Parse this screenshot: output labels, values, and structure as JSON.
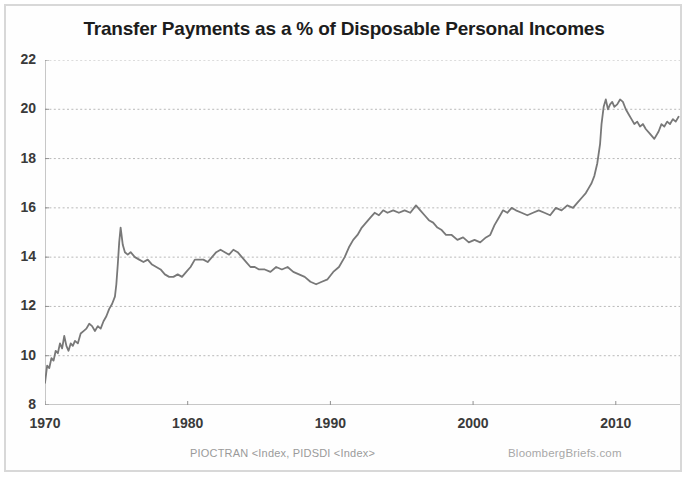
{
  "figure": {
    "title": "Transfer Payments as a % of Disposable Personal Incomes",
    "source_label": "PIOCTRAN <Index, PIDSDI <Index>",
    "brand_label": "BloombergBriefs.com",
    "line_color": "#787878",
    "grid_color": "#b9b9b9",
    "axis_color": "#909090",
    "text_color": "#3a3a3a",
    "border_color": "#d8d8d8"
  },
  "chart_data": {
    "type": "line",
    "title": "Transfer Payments as a % of Disposable Personal Incomes",
    "xlabel": "",
    "ylabel": "",
    "xlim": [
      1970,
      2014.5
    ],
    "ylim": [
      8,
      22
    ],
    "grid": true,
    "legend": "none",
    "y_ticks": [
      8,
      10,
      12,
      14,
      16,
      18,
      20,
      22
    ],
    "y_tick_labels": [
      "8",
      "10",
      "12",
      "14",
      "16",
      "18",
      "20",
      "22"
    ],
    "x_ticks": [
      1970,
      1980,
      1990,
      2000,
      2010
    ],
    "x_tick_labels": [
      "1970",
      "1980",
      "1990",
      "2000",
      "2010"
    ],
    "series": [
      {
        "name": "Transfer Payments as % of Disposable Personal Income",
        "x": [
          1970.0,
          1970.15,
          1970.3,
          1970.45,
          1970.6,
          1970.75,
          1970.9,
          1971.05,
          1971.2,
          1971.35,
          1971.5,
          1971.65,
          1971.8,
          1971.95,
          1972.1,
          1972.3,
          1972.5,
          1972.7,
          1972.9,
          1973.1,
          1973.3,
          1973.5,
          1973.7,
          1973.9,
          1974.1,
          1974.3,
          1974.5,
          1974.7,
          1974.9,
          1975.0,
          1975.1,
          1975.2,
          1975.3,
          1975.45,
          1975.6,
          1975.8,
          1976.0,
          1976.3,
          1976.6,
          1976.9,
          1977.2,
          1977.5,
          1977.8,
          1978.1,
          1978.4,
          1978.7,
          1979.0,
          1979.3,
          1979.6,
          1979.9,
          1980.2,
          1980.5,
          1980.8,
          1981.1,
          1981.4,
          1981.7,
          1982.0,
          1982.3,
          1982.6,
          1982.9,
          1983.2,
          1983.5,
          1983.8,
          1984.1,
          1984.4,
          1984.7,
          1985.0,
          1985.4,
          1985.8,
          1986.2,
          1986.6,
          1987.0,
          1987.4,
          1987.8,
          1988.2,
          1988.6,
          1989.0,
          1989.4,
          1989.8,
          1990.2,
          1990.6,
          1991.0,
          1991.3,
          1991.6,
          1991.9,
          1992.2,
          1992.5,
          1992.8,
          1993.1,
          1993.4,
          1993.7,
          1994.0,
          1994.4,
          1994.8,
          1995.2,
          1995.6,
          1996.0,
          1996.3,
          1996.6,
          1996.9,
          1997.2,
          1997.5,
          1997.8,
          1998.1,
          1998.5,
          1998.9,
          1999.3,
          1999.7,
          2000.1,
          2000.5,
          2000.9,
          2001.2,
          2001.5,
          2001.8,
          2002.1,
          2002.4,
          2002.7,
          2003.0,
          2003.4,
          2003.8,
          2004.2,
          2004.6,
          2005.0,
          2005.4,
          2005.8,
          2006.2,
          2006.6,
          2007.0,
          2007.3,
          2007.6,
          2007.9,
          2008.1,
          2008.3,
          2008.5,
          2008.7,
          2008.9,
          2009.0,
          2009.15,
          2009.3,
          2009.45,
          2009.6,
          2009.75,
          2009.9,
          2010.1,
          2010.3,
          2010.5,
          2010.7,
          2010.9,
          2011.1,
          2011.3,
          2011.5,
          2011.7,
          2011.9,
          2012.1,
          2012.4,
          2012.7,
          2013.0,
          2013.2,
          2013.4,
          2013.6,
          2013.8,
          2014.0,
          2014.2,
          2014.4
        ],
        "y": [
          8.9,
          9.6,
          9.5,
          9.9,
          9.8,
          10.2,
          10.1,
          10.5,
          10.3,
          10.8,
          10.4,
          10.2,
          10.5,
          10.4,
          10.6,
          10.5,
          10.9,
          11.0,
          11.1,
          11.3,
          11.2,
          11.0,
          11.2,
          11.1,
          11.4,
          11.6,
          11.9,
          12.1,
          12.4,
          12.9,
          13.7,
          14.6,
          15.2,
          14.5,
          14.2,
          14.1,
          14.2,
          14.0,
          13.9,
          13.8,
          13.9,
          13.7,
          13.6,
          13.5,
          13.3,
          13.2,
          13.2,
          13.3,
          13.2,
          13.4,
          13.6,
          13.9,
          13.9,
          13.9,
          13.8,
          14.0,
          14.2,
          14.3,
          14.2,
          14.1,
          14.3,
          14.2,
          14.0,
          13.8,
          13.6,
          13.6,
          13.5,
          13.5,
          13.4,
          13.6,
          13.5,
          13.6,
          13.4,
          13.3,
          13.2,
          13.0,
          12.9,
          13.0,
          13.1,
          13.4,
          13.6,
          14.0,
          14.4,
          14.7,
          14.9,
          15.2,
          15.4,
          15.6,
          15.8,
          15.7,
          15.9,
          15.8,
          15.9,
          15.8,
          15.9,
          15.8,
          16.1,
          15.9,
          15.7,
          15.5,
          15.4,
          15.2,
          15.1,
          14.9,
          14.9,
          14.7,
          14.8,
          14.6,
          14.7,
          14.6,
          14.8,
          14.9,
          15.3,
          15.6,
          15.9,
          15.8,
          16.0,
          15.9,
          15.8,
          15.7,
          15.8,
          15.9,
          15.8,
          15.7,
          16.0,
          15.9,
          16.1,
          16.0,
          16.2,
          16.4,
          16.6,
          16.8,
          17.0,
          17.3,
          17.8,
          18.6,
          19.4,
          20.1,
          20.4,
          20.0,
          20.2,
          20.3,
          20.1,
          20.2,
          20.4,
          20.3,
          20.0,
          19.8,
          19.6,
          19.4,
          19.5,
          19.3,
          19.4,
          19.2,
          19.0,
          18.8,
          19.1,
          19.4,
          19.3,
          19.5,
          19.4,
          19.6,
          19.5,
          19.7
        ]
      }
    ]
  }
}
